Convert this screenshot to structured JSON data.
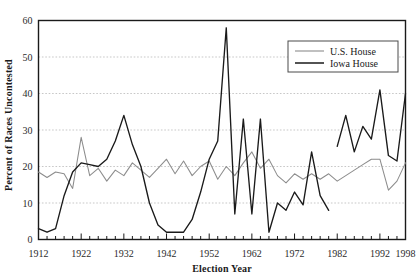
{
  "chart_data": {
    "type": "line",
    "title": "",
    "xlabel": "Election Year",
    "ylabel": "Percent of Races Uncontested",
    "xlim": [
      1912,
      1998
    ],
    "ylim": [
      0,
      60
    ],
    "yticks": [
      0,
      10,
      20,
      30,
      40,
      50,
      60
    ],
    "xticks": [
      1912,
      1922,
      1932,
      1942,
      1952,
      1962,
      1972,
      1982,
      1992,
      1998
    ],
    "xtick_labels": [
      "1912",
      "1922",
      "1932",
      "1942",
      "1952",
      "1962",
      "1972",
      "1982",
      "1992",
      "1998"
    ],
    "ytick_labels": [
      "0",
      "10",
      "20",
      "30",
      "40",
      "50",
      "60"
    ],
    "xtick_minor_step": 2,
    "grid": "horizontal-dashed",
    "legend_position": "top-right",
    "series": [
      {
        "name": "U.S. House",
        "color": "#8c8c8c",
        "x": [
          1912,
          1914,
          1916,
          1918,
          1920,
          1922,
          1924,
          1926,
          1928,
          1930,
          1932,
          1934,
          1936,
          1938,
          1940,
          1942,
          1944,
          1946,
          1948,
          1950,
          1952,
          1954,
          1956,
          1958,
          1960,
          1962,
          1964,
          1966,
          1968,
          1970,
          1972,
          1974,
          1976,
          1978,
          1980,
          1982,
          1984,
          1986,
          1988,
          1990,
          1992,
          1994,
          1996,
          1998
        ],
        "values": [
          18.5,
          17.0,
          18.5,
          18.0,
          14.0,
          28.0,
          17.5,
          19.5,
          16.0,
          19.0,
          17.5,
          21.0,
          19.0,
          17.0,
          19.5,
          22.0,
          18.0,
          21.5,
          17.5,
          20.0,
          21.5,
          16.5,
          20.0,
          17.5,
          21.0,
          24.0,
          19.5,
          22.0,
          17.5,
          15.5,
          18.0,
          16.5,
          18.0,
          16.5,
          18.0,
          16.0,
          17.5,
          19.0,
          20.5,
          22.0,
          22.0,
          13.5,
          16.0,
          21.0
        ]
      },
      {
        "name": "Iowa House",
        "color": "#1a1a1a",
        "x": [
          1912,
          1914,
          1916,
          1918,
          1920,
          1922,
          1924,
          1926,
          1928,
          1930,
          1932,
          1934,
          1936,
          1938,
          1940,
          1942,
          1944,
          1946,
          1948,
          1950,
          1952,
          1954,
          1956,
          1958,
          1960,
          1962,
          1964,
          1966,
          1968,
          1970,
          1972,
          1974,
          1976,
          1978,
          1980
        ],
        "values": [
          3.0,
          2.0,
          3.0,
          12.0,
          18.5,
          21.0,
          20.5,
          20.0,
          22.0,
          27.0,
          34.0,
          26.0,
          20.0,
          10.0,
          4.0,
          2.0,
          2.0,
          2.0,
          5.5,
          13.0,
          22.0,
          27.0,
          58.0,
          7.0,
          33.0,
          7.0,
          33.0,
          2.0,
          10.0,
          8.0,
          13.0,
          9.5,
          24.0,
          12.0,
          8.0
        ],
        "segment2_x": [
          1982,
          1984,
          1986,
          1988,
          1990,
          1992,
          1994,
          1996,
          1998
        ],
        "segment2_values": [
          25.5,
          34.0,
          24.0,
          31.0,
          27.5,
          41.0,
          23.0,
          21.5,
          40.0
        ],
        "has_gap": true
      }
    ]
  },
  "legend": {
    "entries": [
      {
        "label": "U.S. House",
        "color": "#8c8c8c"
      },
      {
        "label": "Iowa House",
        "color": "#1a1a1a"
      }
    ]
  },
  "axes": {
    "xlabel": "Election Year",
    "ylabel": "Percent of Races Uncontested"
  }
}
